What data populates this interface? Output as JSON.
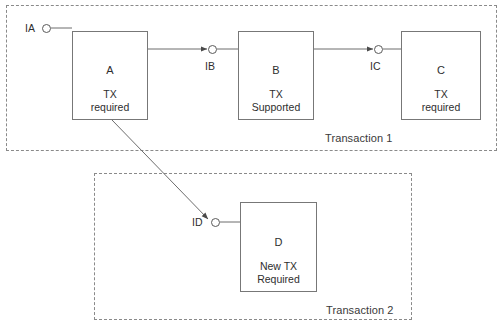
{
  "diagram": {
    "stroke_color": "#777777",
    "dashed_color": "#8a8a8a",
    "text_color": "#2e2e2e",
    "background": "#ffffff"
  },
  "groups": [
    {
      "id": "transaction-1",
      "label": "Transaction 1",
      "x": 6,
      "y": 5,
      "w": 491,
      "h": 146,
      "label_x": 325,
      "label_y": 132
    },
    {
      "id": "transaction-2",
      "label": "Transaction 2",
      "x": 94,
      "y": 173,
      "w": 318,
      "h": 147,
      "label_x": 326,
      "label_y": 304
    }
  ],
  "components": [
    {
      "id": "component-a",
      "name": "A",
      "desc": "TX\nrequired",
      "x": 72,
      "y": 31,
      "w": 76,
      "h": 89
    },
    {
      "id": "component-b",
      "name": "B",
      "desc": "TX\nSupported",
      "x": 238,
      "y": 31,
      "w": 76,
      "h": 89
    },
    {
      "id": "component-c",
      "name": "C",
      "desc": "TX\nrequired",
      "x": 401,
      "y": 31,
      "w": 80,
      "h": 89
    },
    {
      "id": "component-d",
      "name": "D",
      "desc": "New TX\nRequired",
      "x": 240,
      "y": 202,
      "w": 77,
      "h": 90
    }
  ],
  "interfaces": [
    {
      "id": "interface-ia",
      "label": "IA",
      "cx": 46,
      "cy": 28,
      "label_x": 25,
      "label_y": 22
    },
    {
      "id": "interface-ib",
      "label": "IB",
      "cx": 212,
      "cy": 49,
      "label_x": 205,
      "label_y": 60
    },
    {
      "id": "interface-ic",
      "label": "IC",
      "cx": 378,
      "cy": 49,
      "label_x": 370,
      "label_y": 60
    },
    {
      "id": "interface-id",
      "label": "ID",
      "cx": 215,
      "cy": 222,
      "label_x": 192,
      "label_y": 216
    }
  ],
  "connections": [
    {
      "id": "wire-ia-to-a",
      "from": "IA",
      "to": "A",
      "arrow": false
    },
    {
      "id": "wire-a-to-ib",
      "from": "A",
      "to": "IB",
      "arrow": true
    },
    {
      "id": "wire-ib-to-b",
      "from": "IB",
      "to": "B",
      "arrow": false
    },
    {
      "id": "wire-b-to-ic",
      "from": "B",
      "to": "IC",
      "arrow": true
    },
    {
      "id": "wire-ic-to-c",
      "from": "IC",
      "to": "C",
      "arrow": false
    },
    {
      "id": "wire-a-to-id",
      "from": "A",
      "to": "ID",
      "arrow": true
    },
    {
      "id": "wire-id-to-d",
      "from": "ID",
      "to": "D",
      "arrow": false
    }
  ]
}
